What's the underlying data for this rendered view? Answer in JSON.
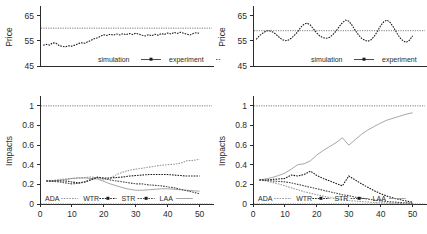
{
  "figure": {
    "layout": "2x2 grid of scientific line plots",
    "background_color": "#ffffff",
    "ink_color": "#2b2b2b"
  },
  "panels": [
    {
      "id": "top-left",
      "ylabel": "Price",
      "yticks": [
        "45",
        "55",
        "65"
      ],
      "legend": [
        "simulation",
        "experiment"
      ]
    },
    {
      "id": "top-right",
      "ylabel": "Price",
      "yticks": [
        "45",
        "55",
        "65"
      ],
      "legend": [
        "simulation",
        "experiment"
      ]
    },
    {
      "id": "bottom-left",
      "ylabel": "Impacts",
      "yticks": [
        "0",
        "0.2",
        "0.4",
        "0.6",
        "0.8",
        "1"
      ],
      "xticks": [
        "0",
        "10",
        "20",
        "30",
        "40",
        "50"
      ],
      "legend": [
        "ADA",
        "WTR",
        "STR",
        "LAA"
      ]
    },
    {
      "id": "bottom-right",
      "ylabel": "Impacts",
      "yticks": [
        "0",
        "0.2",
        "0.4",
        "0.6",
        "0.8",
        "1"
      ],
      "xticks": [
        "0",
        "10",
        "20",
        "30",
        "40",
        "50"
      ],
      "legend": [
        "ADA",
        "WTR",
        "STR",
        "LAA"
      ]
    }
  ],
  "chart_data": [
    {
      "type": "line",
      "id": "top-left-price",
      "title": "",
      "xlabel": "",
      "ylabel": "Price",
      "ylim": [
        45,
        68
      ],
      "xlim": [
        0,
        52
      ],
      "yticks": [
        45,
        55,
        65
      ],
      "grid": false,
      "legend_position": "inside-bottom",
      "annotations": [
        "dotted horizontal reference line at Price = 60"
      ],
      "reference_lines": [
        {
          "y": 60,
          "style": "dotted"
        }
      ],
      "series": [
        {
          "name": "simulation",
          "style": "dashed-with-markers",
          "x": [
            1,
            2,
            3,
            4,
            5,
            6,
            7,
            8,
            9,
            10,
            11,
            12,
            13,
            14,
            15,
            16,
            17,
            18,
            19,
            20,
            21,
            22,
            23,
            24,
            25,
            26,
            27,
            28,
            29,
            30,
            31,
            32,
            33,
            34,
            35,
            36,
            37,
            38,
            39,
            40,
            41,
            42,
            43,
            44,
            45,
            46,
            47,
            48,
            49,
            50
          ],
          "values": [
            53.2,
            53.6,
            53.3,
            54.2,
            54.0,
            53.1,
            52.8,
            52.6,
            53.0,
            52.9,
            53.3,
            53.9,
            54.2,
            54.0,
            54.6,
            55.2,
            55.8,
            56.2,
            56.8,
            57.4,
            57.1,
            57.6,
            57.2,
            57.7,
            57.3,
            57.8,
            57.4,
            57.9,
            57.5,
            58.0,
            57.6,
            57.2,
            56.9,
            57.4,
            57.0,
            57.6,
            57.2,
            57.9,
            57.5,
            58.1,
            57.7,
            58.3,
            57.9,
            58.4,
            58.0,
            57.6,
            57.3,
            57.9,
            58.2,
            57.9
          ]
        },
        {
          "name": "experiment",
          "style": "dotted-reference",
          "values": [
            60
          ]
        }
      ]
    },
    {
      "type": "line",
      "id": "top-right-price",
      "title": "",
      "xlabel": "",
      "ylabel": "Price",
      "ylim": [
        45,
        68
      ],
      "xlim": [
        0,
        52
      ],
      "yticks": [
        45,
        55,
        65
      ],
      "grid": false,
      "legend_position": "inside-bottom",
      "annotations": [
        "dotted horizontal reference line at Price = 59; oscillating simulation with ~4.5 cycles"
      ],
      "reference_lines": [
        {
          "y": 59,
          "style": "dotted"
        }
      ],
      "series": [
        {
          "name": "simulation",
          "style": "dashed-with-markers",
          "x": [
            1,
            2,
            3,
            4,
            5,
            6,
            7,
            8,
            9,
            10,
            11,
            12,
            13,
            14,
            15,
            16,
            17,
            18,
            19,
            20,
            21,
            22,
            23,
            24,
            25,
            26,
            27,
            28,
            29,
            30,
            31,
            32,
            33,
            34,
            35,
            36,
            37,
            38,
            39,
            40,
            41,
            42,
            43,
            44,
            45,
            46,
            47,
            48,
            49,
            50
          ],
          "values": [
            55.6,
            57.0,
            58.0,
            58.8,
            59.0,
            58.6,
            57.8,
            56.6,
            55.6,
            55.0,
            55.2,
            56.0,
            57.2,
            58.6,
            60.4,
            61.6,
            62.0,
            61.2,
            59.6,
            58.0,
            56.8,
            56.2,
            56.0,
            56.4,
            57.4,
            58.8,
            60.6,
            62.2,
            63.2,
            62.8,
            61.2,
            59.2,
            57.4,
            56.0,
            55.2,
            54.8,
            55.4,
            56.8,
            58.8,
            61.0,
            62.6,
            63.2,
            62.2,
            60.4,
            58.2,
            56.2,
            55.0,
            54.4,
            55.2,
            57.0
          ]
        },
        {
          "name": "experiment",
          "style": "dotted-reference",
          "values": [
            59
          ]
        }
      ]
    },
    {
      "type": "line",
      "id": "bottom-left-impacts",
      "title": "",
      "xlabel": "",
      "ylabel": "Impacts",
      "ylim": [
        0,
        1.08
      ],
      "xlim": [
        0,
        52
      ],
      "yticks": [
        0,
        0.2,
        0.4,
        0.6,
        0.8,
        1
      ],
      "xticks": [
        0,
        10,
        20,
        30,
        40,
        50
      ],
      "grid": false,
      "legend_position": "inside-bottom",
      "annotations": [
        "dotted reference lines at Impacts = 1 and Impacts = 0"
      ],
      "reference_lines": [
        {
          "y": 1,
          "style": "dotted"
        },
        {
          "y": 0,
          "style": "dotted"
        }
      ],
      "x": [
        2,
        4,
        6,
        8,
        10,
        12,
        14,
        16,
        18,
        20,
        22,
        24,
        26,
        28,
        30,
        32,
        34,
        36,
        38,
        40,
        42,
        44,
        46,
        48,
        50
      ],
      "series": [
        {
          "name": "ADA",
          "style": "light-dashed",
          "values": [
            0.235,
            0.24,
            0.25,
            0.255,
            0.26,
            0.265,
            0.27,
            0.275,
            0.265,
            0.245,
            0.265,
            0.3,
            0.325,
            0.345,
            0.355,
            0.365,
            0.375,
            0.385,
            0.395,
            0.4,
            0.405,
            0.415,
            0.44,
            0.445,
            0.455
          ]
        },
        {
          "name": "WTR",
          "style": "light-thin",
          "values": [
            0.235,
            0.235,
            0.24,
            0.25,
            0.26,
            0.265,
            0.265,
            0.26,
            0.255,
            0.23,
            0.205,
            0.185,
            0.165,
            0.15,
            0.14,
            0.14,
            0.145,
            0.15,
            0.155,
            0.155,
            0.15,
            0.145,
            0.14,
            0.135,
            0.13
          ]
        },
        {
          "name": "STR",
          "style": "dark-dashed",
          "values": [
            0.235,
            0.235,
            0.235,
            0.235,
            0.225,
            0.215,
            0.225,
            0.245,
            0.27,
            0.265,
            0.265,
            0.27,
            0.275,
            0.285,
            0.29,
            0.295,
            0.3,
            0.3,
            0.3,
            0.3,
            0.295,
            0.29,
            0.285,
            0.285,
            0.285
          ]
        },
        {
          "name": "LAA",
          "style": "dark-dashed-2",
          "values": [
            0.235,
            0.23,
            0.225,
            0.215,
            0.205,
            0.21,
            0.225,
            0.25,
            0.275,
            0.26,
            0.245,
            0.235,
            0.225,
            0.215,
            0.205,
            0.205,
            0.195,
            0.19,
            0.185,
            0.175,
            0.165,
            0.15,
            0.135,
            0.12,
            0.105
          ]
        }
      ]
    },
    {
      "type": "line",
      "id": "bottom-right-impacts",
      "title": "",
      "xlabel": "",
      "ylabel": "Impacts",
      "ylim": [
        0,
        1.08
      ],
      "xlim": [
        0,
        52
      ],
      "yticks": [
        0,
        0.2,
        0.4,
        0.6,
        0.8,
        1
      ],
      "xticks": [
        0,
        10,
        20,
        30,
        40,
        50
      ],
      "grid": false,
      "legend_position": "inside-bottom",
      "annotations": [
        "dotted reference lines at Impacts = 1 and Impacts = 0; ADA rises to ~0.93; STR and LAA show sawtooth peaks near x=18 and x=29"
      ],
      "reference_lines": [
        {
          "y": 1,
          "style": "dotted"
        },
        {
          "y": 0,
          "style": "dotted"
        }
      ],
      "x": [
        2,
        4,
        6,
        8,
        10,
        12,
        14,
        16,
        18,
        20,
        22,
        24,
        26,
        28,
        30,
        32,
        34,
        36,
        38,
        40,
        42,
        44,
        46,
        48,
        50
      ],
      "series": [
        {
          "name": "ADA",
          "style": "light-thin",
          "values": [
            0.245,
            0.255,
            0.27,
            0.29,
            0.315,
            0.355,
            0.4,
            0.41,
            0.44,
            0.5,
            0.545,
            0.585,
            0.625,
            0.675,
            0.6,
            0.655,
            0.71,
            0.755,
            0.79,
            0.825,
            0.855,
            0.875,
            0.895,
            0.915,
            0.93
          ]
        },
        {
          "name": "WTR",
          "style": "light-dashed",
          "values": [
            0.245,
            0.235,
            0.22,
            0.205,
            0.185,
            0.165,
            0.145,
            0.125,
            0.11,
            0.095,
            0.08,
            0.065,
            0.055,
            0.045,
            0.035,
            0.03,
            0.025,
            0.02,
            0.015,
            0.012,
            0.01,
            0.008,
            0.006,
            0.004,
            0.003
          ]
        },
        {
          "name": "STR",
          "style": "dark-dashed",
          "values": [
            0.245,
            0.245,
            0.25,
            0.255,
            0.26,
            0.295,
            0.285,
            0.3,
            0.335,
            0.29,
            0.26,
            0.235,
            0.21,
            0.185,
            0.285,
            0.245,
            0.205,
            0.17,
            0.135,
            0.105,
            0.08,
            0.06,
            0.045,
            0.03,
            0.018
          ]
        },
        {
          "name": "LAA",
          "style": "dark-dashed-2",
          "values": [
            0.245,
            0.24,
            0.235,
            0.23,
            0.225,
            0.215,
            0.2,
            0.185,
            0.17,
            0.155,
            0.14,
            0.125,
            0.11,
            0.095,
            0.085,
            0.07,
            0.06,
            0.05,
            0.04,
            0.032,
            0.025,
            0.02,
            0.015,
            0.012,
            0.008
          ]
        }
      ]
    }
  ]
}
